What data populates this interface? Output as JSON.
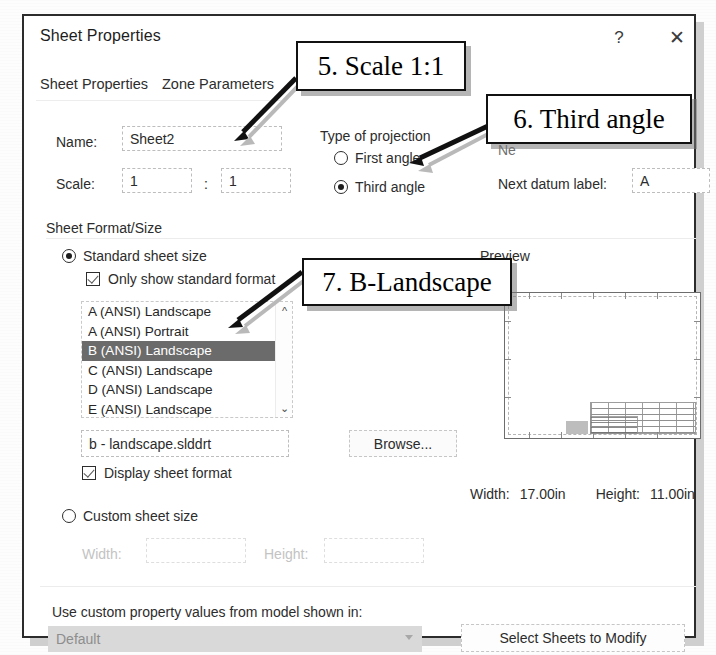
{
  "dialog": {
    "title": "Sheet Properties",
    "help_icon": "question-mark-icon",
    "close_icon": "close-icon",
    "tabs": [
      {
        "label": "Sheet Properties",
        "active": true
      },
      {
        "label": "Zone Parameters",
        "active": false
      }
    ]
  },
  "general": {
    "name_label": "Name:",
    "name_value": "Sheet2",
    "scale_label": "Scale:",
    "scale_numerator": "1",
    "scale_separator": ":",
    "scale_denominator": "1"
  },
  "projection": {
    "group_label": "Type of projection",
    "options": [
      {
        "label": "First angle",
        "selected": false
      },
      {
        "label": "Third angle",
        "selected": true
      }
    ],
    "occluded_label": "Ne",
    "datum_label": "Next datum label:",
    "datum_value": "A"
  },
  "sheet_format": {
    "group_label": "Sheet Format/Size",
    "standard_radio": {
      "label": "Standard sheet size",
      "selected": true
    },
    "only_standard_checkbox": {
      "label": "Only show standard format",
      "checked": true
    },
    "size_list": [
      {
        "label": "A (ANSI) Landscape",
        "selected": false
      },
      {
        "label": "A (ANSI) Portrait",
        "selected": false
      },
      {
        "label": "B (ANSI) Landscape",
        "selected": true
      },
      {
        "label": "C (ANSI) Landscape",
        "selected": false
      },
      {
        "label": "D (ANSI) Landscape",
        "selected": false
      },
      {
        "label": "E (ANSI) Landscape",
        "selected": false
      }
    ],
    "scroll_up_icon": "chevron-up-icon",
    "scroll_down_icon": "chevron-down-icon",
    "format_file": "b - landscape.slddrt",
    "browse_label": "Browse...",
    "display_sheet_format": {
      "label": "Display sheet format",
      "checked": true
    },
    "custom_radio": {
      "label": "Custom sheet size",
      "selected": false
    },
    "custom_width_label": "Width:",
    "custom_width_value": "",
    "custom_height_label": "Height:",
    "custom_height_value": ""
  },
  "preview": {
    "label": "Preview",
    "width_label": "Width:",
    "width_value": "17.00in",
    "height_label": "Height:",
    "height_value": "11.00in"
  },
  "bottom": {
    "custom_property_label": "Use custom property values from model shown in:",
    "combo_value": "Default",
    "combo_caret_icon": "chevron-down-icon",
    "select_sheets_label": "Select Sheets to Modify"
  },
  "annotations": [
    {
      "id": "callout-5",
      "text": "5. Scale 1:1"
    },
    {
      "id": "callout-6",
      "text": "6. Third angle"
    },
    {
      "id": "callout-7",
      "text": "7. B-Landscape"
    }
  ],
  "colors": {
    "selection": "#6b6b6b",
    "dialog_border": "#2c2c2c",
    "disabled_text": "#bdbdbd",
    "combo_disabled_bg": "#d9d9d9"
  }
}
